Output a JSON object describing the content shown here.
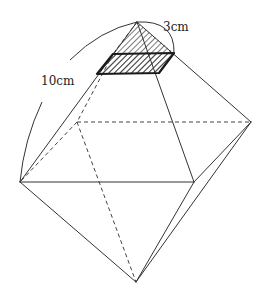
{
  "figure": {
    "type": "regular octahedron with cross-section",
    "labels": {
      "edge_length": "10cm",
      "cut_length": "3cm"
    },
    "vertices": {
      "top": [
        137,
        22
      ],
      "bottom": [
        136,
        282
      ],
      "front_left": [
        20,
        182
      ],
      "front_right": [
        194,
        182
      ],
      "back_left": [
        77,
        122
      ],
      "back_right": [
        251,
        122
      ]
    },
    "cross_section": {
      "shading": "hatched",
      "corners": [
        [
          97,
          74
        ],
        [
          159,
          73
        ],
        [
          174,
          53
        ],
        [
          113,
          54
        ]
      ]
    },
    "colors": {
      "line": "#333333",
      "section_border": "#1a1a1a",
      "background": "#ffffff"
    }
  }
}
